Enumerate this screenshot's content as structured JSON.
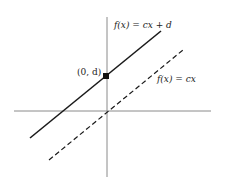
{
  "figure": {
    "colors": {
      "axis": "#8a8a8a",
      "line": "#1a1a1a",
      "background": "#ffffff"
    },
    "axes": {
      "origin_px": [
        107,
        111
      ],
      "x_axis_px": [
        14,
        211
      ],
      "y_axis_px": [
        17,
        177
      ]
    },
    "lines": [
      {
        "name": "shifted-line",
        "style": "solid",
        "label_f": "f",
        "label_x": "(x)",
        "label_rest": " = cx + d",
        "label_full": "f(x) = cx + d",
        "from_px": [
          30,
          138
        ],
        "to_px": [
          161,
          31
        ]
      },
      {
        "name": "base-line",
        "style": "dashed",
        "label_full": "f(x) = cx",
        "from_px": [
          49,
          160
        ],
        "to_px": [
          183,
          50
        ]
      }
    ],
    "point": {
      "label": "(0, d)",
      "px": [
        106,
        76
      ]
    }
  }
}
